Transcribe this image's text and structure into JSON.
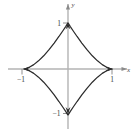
{
  "figure": {
    "equation": "x^(2/3) + y^(2/3) = 1",
    "background_color": "#ffffff",
    "curve_color": "#2b2b2b",
    "axis_color": "#b0b0b0",
    "tick_color": "#808080",
    "label_color": "#3a3a3a"
  },
  "axes": {
    "x_label": "x",
    "y_label": "y",
    "origin_px": {
      "x": 68,
      "y": 69
    },
    "unit_px": {
      "x": 44,
      "y": 46
    },
    "x_range": [
      -1.36,
      1.36
    ],
    "y_range": [
      -1.28,
      1.43
    ],
    "grid": "off",
    "arrowheads": [
      "x-positive",
      "y-positive"
    ]
  },
  "ticks": {
    "x": [
      {
        "value": -1,
        "label": "−1"
      },
      {
        "value": 1,
        "label": "1"
      }
    ],
    "y": [
      {
        "value": 1,
        "label": "1"
      },
      {
        "value": -1,
        "label": "−1"
      }
    ]
  },
  "chart_data": {
    "type": "line",
    "title": "",
    "subtitle": "",
    "xlabel": "x",
    "ylabel": "y",
    "xlim": [
      -1.36,
      1.36
    ],
    "ylim": [
      -1.28,
      1.43
    ],
    "grid": false,
    "legend": null,
    "annotations": [],
    "series": [
      {
        "name": "astroid",
        "equation": "x^(2/3) + y^(2/3) = 1",
        "parametric": "x = cos^3(t), y = sin^3(t)",
        "closed": true,
        "color": "#2b2b2b",
        "cusps": [
          {
            "x": 1,
            "y": 0
          },
          {
            "x": 0,
            "y": 1
          },
          {
            "x": -1,
            "y": 0
          },
          {
            "x": 0,
            "y": -1
          }
        ],
        "x": [
          1,
          0.985,
          0.941,
          0.87,
          0.778,
          0.67,
          0.552,
          0.431,
          0.314,
          0.206,
          0.116,
          0.049,
          0.011,
          0,
          -0.011,
          -0.049,
          -0.116,
          -0.206,
          -0.314,
          -0.431,
          -0.552,
          -0.67,
          -0.778,
          -0.87,
          -0.941,
          -0.985,
          -1,
          -0.985,
          -0.941,
          -0.87,
          -0.778,
          -0.67,
          -0.552,
          -0.431,
          -0.314,
          -0.206,
          -0.116,
          -0.049,
          -0.011,
          0,
          0.011,
          0.049,
          0.116,
          0.206,
          0.314,
          0.431,
          0.552,
          0.67,
          0.778,
          0.87,
          0.941,
          0.985,
          1
        ],
        "y": [
          0,
          0.002,
          0.013,
          0.042,
          0.095,
          0.177,
          0.287,
          0.42,
          0.565,
          0.707,
          0.832,
          0.927,
          0.985,
          1,
          0.985,
          0.927,
          0.832,
          0.707,
          0.565,
          0.42,
          0.287,
          0.177,
          0.095,
          0.042,
          0.013,
          0.002,
          0,
          -0.002,
          -0.013,
          -0.042,
          -0.095,
          -0.177,
          -0.287,
          -0.42,
          -0.565,
          -0.707,
          -0.832,
          -0.927,
          -0.985,
          -1,
          -0.985,
          -0.927,
          -0.832,
          -0.707,
          -0.565,
          -0.42,
          -0.287,
          -0.177,
          -0.095,
          -0.042,
          -0.013,
          -0.002,
          0
        ]
      }
    ]
  }
}
